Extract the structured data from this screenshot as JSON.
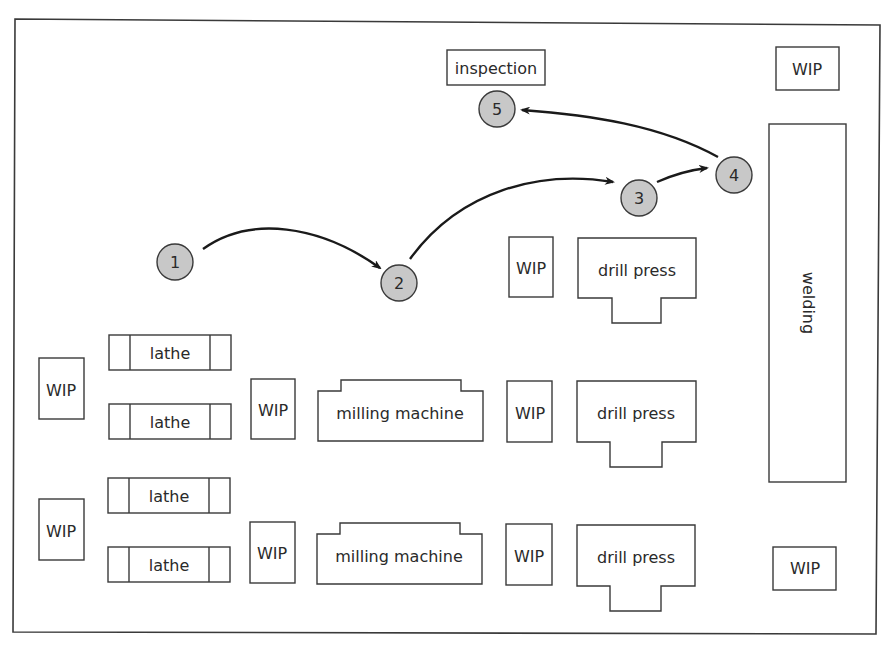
{
  "diagram": {
    "colors": {
      "outline": "#3a3a3a",
      "node_fill": "#c8c8c8",
      "arrow": "#1a1a1a",
      "background": "#ffffff"
    },
    "stations": {
      "inspection": "inspection",
      "welding": "welding",
      "wip_top_right": "WIP",
      "wip_bottom_right": "WIP",
      "wip_left_upper": "WIP",
      "wip_left_lower": "WIP",
      "wip_mill_upper": "WIP",
      "wip_mill_lower": "WIP",
      "wip_drill_top": "WIP",
      "wip_drill_mid": "WIP",
      "wip_drill_bottom": "WIP",
      "lathes": [
        "lathe",
        "lathe",
        "lathe",
        "lathe"
      ],
      "milling_machines": [
        "milling machine",
        "milling machine"
      ],
      "drill_presses": [
        "drill press",
        "drill press",
        "drill press"
      ]
    },
    "flow_steps": [
      "1",
      "2",
      "3",
      "4",
      "5"
    ],
    "flow_edges": [
      {
        "from": "1",
        "to": "2"
      },
      {
        "from": "2",
        "to": "3"
      },
      {
        "from": "3",
        "to": "4"
      },
      {
        "from": "4",
        "to": "5"
      }
    ]
  }
}
